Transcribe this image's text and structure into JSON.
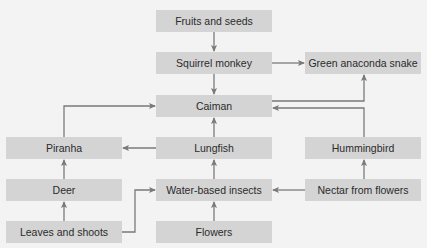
{
  "colors": {
    "background": "#f3f3f3",
    "node_fill": "#d4d4d4",
    "text": "#2b2b2b",
    "arrow": "#7a7a7a"
  },
  "nodes": {
    "fruits": "Fruits and seeds",
    "monkey": "Squirrel monkey",
    "anaconda": "Green anaconda snake",
    "caiman": "Caiman",
    "piranha": "Piranha",
    "lungfish": "Lungfish",
    "hummingbird": "Hummingbird",
    "deer": "Deer",
    "insects": "Water-based insects",
    "nectar": "Nectar from flowers",
    "leaves": "Leaves and shoots",
    "flowers": "Flowers"
  },
  "edges": [
    {
      "from": "Fruits and seeds",
      "to": "Squirrel monkey"
    },
    {
      "from": "Squirrel monkey",
      "to": "Caiman"
    },
    {
      "from": "Squirrel monkey",
      "to": "Green anaconda snake"
    },
    {
      "from": "Caiman",
      "to": "Green anaconda snake"
    },
    {
      "from": "Hummingbird",
      "to": "Caiman"
    },
    {
      "from": "Piranha",
      "to": "Caiman"
    },
    {
      "from": "Lungfish",
      "to": "Caiman"
    },
    {
      "from": "Lungfish",
      "to": "Piranha"
    },
    {
      "from": "Deer",
      "to": "Piranha"
    },
    {
      "from": "Leaves and shoots",
      "to": "Deer"
    },
    {
      "from": "Leaves and shoots",
      "to": "Water-based insects"
    },
    {
      "from": "Water-based insects",
      "to": "Lungfish"
    },
    {
      "from": "Flowers",
      "to": "Water-based insects"
    },
    {
      "from": "Nectar from flowers",
      "to": "Water-based insects"
    },
    {
      "from": "Nectar from flowers",
      "to": "Hummingbird"
    }
  ]
}
